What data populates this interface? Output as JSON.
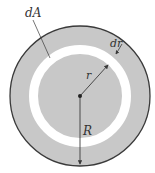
{
  "diagram": {
    "type": "annular-area-element",
    "labels": {
      "area_element": "dA",
      "ring_width": "dr",
      "inner_radius": "r",
      "outer_radius": "R"
    },
    "colors": {
      "fill": "#c8c8c8",
      "ring": "#ffffff",
      "stroke": "#3a3a3a",
      "background": "#ffffff"
    },
    "geometry": {
      "center": [
        80,
        96
      ],
      "outer_radius": 70,
      "ring_outer_radius": 51,
      "ring_inner_radius": 42
    }
  }
}
